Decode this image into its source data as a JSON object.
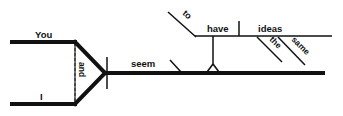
{
  "diagram": {
    "type": "sentence-diagram",
    "background": "#ffffff",
    "ink": "#111111",
    "subjects": [
      {
        "word": "You"
      },
      {
        "word": "I"
      }
    ],
    "conjunction": "and",
    "verb": "seem",
    "infinitive": {
      "marker": "to",
      "verb": "have",
      "object": "ideas",
      "modifiers": [
        "the",
        "same"
      ]
    }
  }
}
